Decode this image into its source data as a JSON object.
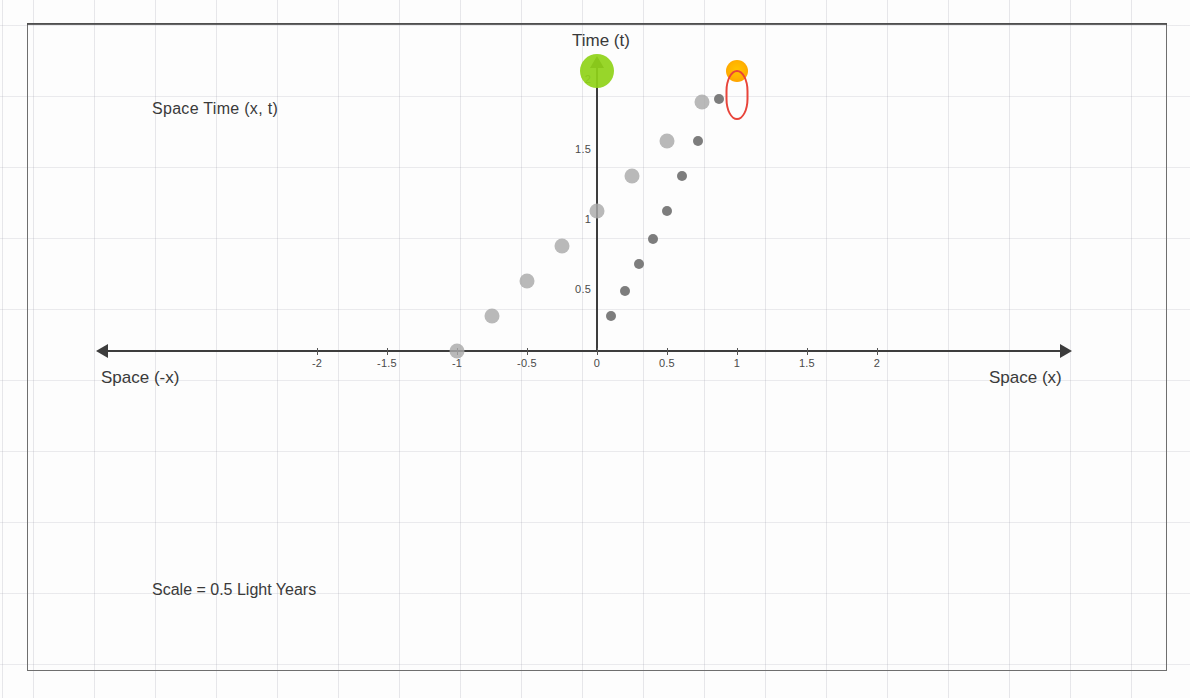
{
  "figure": {
    "title_axis_y": "Time (t)",
    "label_axis_x_positive": "Space (x)",
    "label_axis_x_negative": "Space (-x)",
    "annotation_spacetime": "Space  Time  (x, t)",
    "annotation_scale": "Scale = 0.5 Light Years"
  },
  "colors": {
    "axis": "#3d3d3d",
    "grid": "#c9c9d4",
    "series_left": "#a9a9a9",
    "series_right": "#6f6f6f",
    "marker_green": "#8fd318",
    "marker_orange": "#ffb300",
    "ellipse_red": "#e8443a",
    "frame": "#6f6f6f",
    "text": "#3a3a3a"
  },
  "chart_data": {
    "type": "scatter",
    "title": "",
    "xlabel": "Space (x)",
    "ylabel": "Time (t)",
    "xlim": [
      -2.6,
      2.7
    ],
    "ylim": [
      -0.45,
      2.2
    ],
    "grid": true,
    "legend": "none",
    "xticks": [
      -2,
      -1.5,
      -1,
      -0.5,
      0,
      0.5,
      1,
      1.5,
      2
    ],
    "xtick_labels": [
      "-2",
      "-1.5",
      "-1",
      "-0.5",
      "0",
      "0.5",
      "1",
      "1.5",
      "2"
    ],
    "yticks": [
      0.5,
      1,
      1.5,
      2
    ],
    "ytick_labels": [
      "0.5",
      "1",
      "1.5",
      "2"
    ],
    "series": [
      {
        "name": "left-worldline",
        "color": "#a9a9a9",
        "marker_size": 15,
        "points": [
          {
            "x": -1.0,
            "t": 0.0
          },
          {
            "x": -0.75,
            "t": 0.25
          },
          {
            "x": -0.5,
            "t": 0.5
          },
          {
            "x": -0.25,
            "t": 0.75
          },
          {
            "x": 0.0,
            "t": 1.0
          },
          {
            "x": 0.25,
            "t": 1.25
          },
          {
            "x": 0.5,
            "t": 1.5
          },
          {
            "x": 0.75,
            "t": 1.78
          }
        ]
      },
      {
        "name": "right-worldline",
        "color": "#6f6f6f",
        "marker_size": 10,
        "points": [
          {
            "x": 0.1,
            "t": 0.25
          },
          {
            "x": 0.2,
            "t": 0.43
          },
          {
            "x": 0.3,
            "t": 0.62
          },
          {
            "x": 0.4,
            "t": 0.8
          },
          {
            "x": 0.5,
            "t": 1.0
          },
          {
            "x": 0.61,
            "t": 1.25
          },
          {
            "x": 0.72,
            "t": 1.5
          },
          {
            "x": 0.87,
            "t": 1.8
          }
        ]
      }
    ],
    "markers": [
      {
        "name": "green-event",
        "x": 0.0,
        "t": 2.0,
        "color": "#8fd318",
        "size": 34
      },
      {
        "name": "orange-event",
        "x": 1.0,
        "t": 2.0,
        "color": "#ffb300",
        "size": 22
      }
    ],
    "annotations": [
      {
        "name": "red-ellipse-highlight",
        "x": 1.0,
        "t": 1.83,
        "shape": "ellipse",
        "color": "#e8443a"
      },
      {
        "name": "scale-note",
        "text": "Scale = 0.5 Light Years"
      },
      {
        "name": "spacetime-note",
        "text": "Space  Time  (x, t)"
      }
    ]
  }
}
